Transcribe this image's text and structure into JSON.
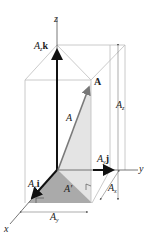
{
  "figure": {
    "axes": {
      "x": "x",
      "y": "y",
      "z": "z"
    },
    "vector": {
      "name": "A",
      "magnitude_label": "A",
      "projection_label": "A'"
    },
    "components": {
      "x": {
        "scalar": "A",
        "sub": "x",
        "unit": "i"
      },
      "y": {
        "scalar": "A",
        "sub": "y",
        "unit": "j"
      },
      "z": {
        "scalar": "A",
        "sub": "z",
        "unit": "k"
      }
    },
    "dimensions": {
      "x": {
        "scalar": "A",
        "sub": "x"
      },
      "y": {
        "scalar": "A",
        "sub": "y"
      },
      "z": {
        "scalar": "A",
        "sub": "z"
      }
    },
    "colors": {
      "box_lines": "#b8b8b8",
      "axis": "#444444",
      "component_arrow": "#111111",
      "vector": "#8a8a8a",
      "shade_dark": "#a9a9a9",
      "shade_light": "#e2e2e2"
    }
  }
}
